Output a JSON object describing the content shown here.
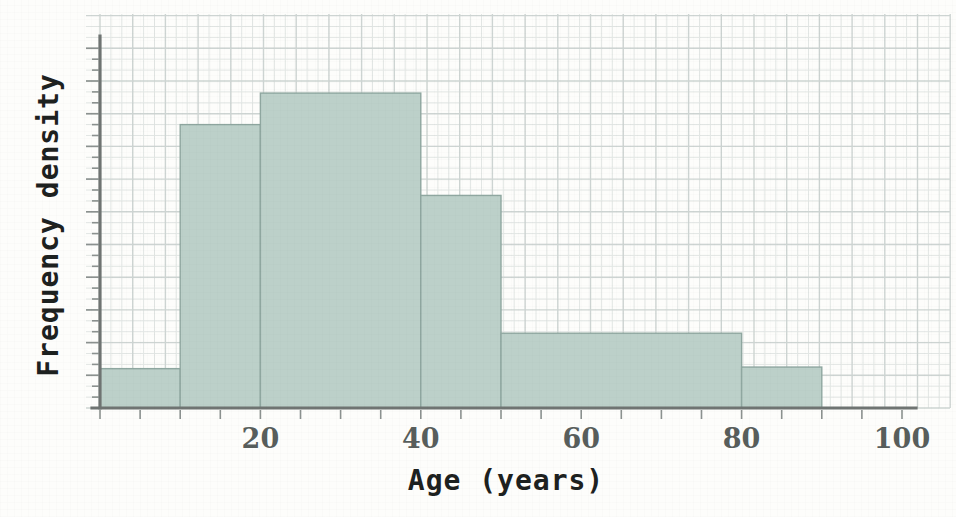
{
  "chart_data": {
    "type": "bar",
    "title": "",
    "subtitle": "",
    "xlabel": "Age (years)",
    "ylabel": "Frequency density",
    "xlim": [
      0,
      100
    ],
    "ylim": [
      0,
      4.7
    ],
    "grid": true,
    "legend": "none",
    "x_tick_labels": [
      "20",
      "40",
      "60",
      "80",
      "100"
    ],
    "x_tick_values": [
      20,
      40,
      60,
      80,
      100
    ],
    "x_minor_tick_step": 5,
    "y_tick_labels": [],
    "bins": [
      {
        "label": "0-10",
        "x_start": 0,
        "x_end": 10,
        "value": 0.5
      },
      {
        "label": "10-20",
        "x_start": 10,
        "x_end": 20,
        "value": 3.6
      },
      {
        "label": "20-40",
        "x_start": 20,
        "x_end": 40,
        "value": 4.0
      },
      {
        "label": "40-50",
        "x_start": 40,
        "x_end": 50,
        "value": 2.7
      },
      {
        "label": "50-80",
        "x_start": 50,
        "x_end": 80,
        "value": 0.95
      },
      {
        "label": "80-90",
        "x_start": 80,
        "x_end": 90,
        "value": 0.52
      }
    ],
    "categories": [
      "0-10",
      "10-20",
      "20-40",
      "40-50",
      "50-80",
      "80-90"
    ],
    "values": [
      0.5,
      3.6,
      4.0,
      2.7,
      0.95,
      0.52
    ],
    "colors": {
      "bar_fill": "#bcd0c9",
      "bar_stroke": "#8fa7a0",
      "axis": "#6f7472",
      "grid_minor": "#e2e6e4",
      "grid_major": "#cdd4d2",
      "background": "#fdfdfb",
      "label_text": "#1d2120",
      "tick_text": "#585e5c"
    }
  }
}
